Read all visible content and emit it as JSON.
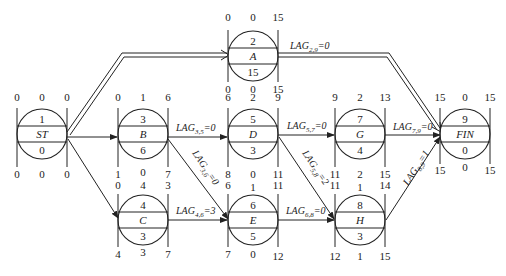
{
  "diagram": {
    "type": "precedence network (single-code)",
    "nodes": [
      {
        "id": "1",
        "name": "ST",
        "duration": "0",
        "es": "0",
        "tf": "0",
        "ef": "0",
        "ls": "0",
        "ff": "0",
        "lf": "0",
        "cx": 42,
        "cy": 134
      },
      {
        "id": "2",
        "name": "A",
        "duration": "15",
        "es": "0",
        "tf": "0",
        "ef": "15",
        "ls": "0",
        "ff": "0",
        "lf": "15",
        "cx": 253,
        "cy": 56
      },
      {
        "id": "3",
        "name": "B",
        "duration": "6",
        "es": "0",
        "tf": "1",
        "ef": "6",
        "ls": "1",
        "ff": "0",
        "lf": "7",
        "cx": 143,
        "cy": 134
      },
      {
        "id": "4",
        "name": "C",
        "duration": "3",
        "es": "0",
        "tf": "4",
        "ef": "3",
        "ls": "4",
        "ff": "3",
        "lf": "7",
        "cx": 143,
        "cy": 220
      },
      {
        "id": "5",
        "name": "D",
        "duration": "3",
        "es": "6",
        "tf": "2",
        "ef": "9",
        "ls": "8",
        "ff": "0",
        "lf": "11",
        "cx": 253,
        "cy": 134
      },
      {
        "id": "6",
        "name": "E",
        "duration": "5",
        "es": "6",
        "tf": "1",
        "ef": "11",
        "ls": "7",
        "ff": "0",
        "lf": "12",
        "cx": 253,
        "cy": 220
      },
      {
        "id": "7",
        "name": "G",
        "duration": "4",
        "es": "9",
        "tf": "2",
        "ef": "13",
        "ls": "11",
        "ff": "2",
        "lf": "15",
        "cx": 360,
        "cy": 134
      },
      {
        "id": "8",
        "name": "H",
        "duration": "3",
        "es": "11",
        "tf": "1",
        "ef": "14",
        "ls": "12",
        "ff": "1",
        "lf": "15",
        "cx": 360,
        "cy": 220
      },
      {
        "id": "9",
        "name": "FIN",
        "duration": "0",
        "es": "15",
        "tf": "0",
        "ef": "15",
        "ls": "15",
        "ff": "0",
        "lf": "15",
        "cx": 465,
        "cy": 134
      }
    ],
    "edges": [
      {
        "from": "1",
        "to": "2",
        "critical": true,
        "lag_label": ""
      },
      {
        "from": "1",
        "to": "3",
        "critical": false,
        "lag_label": ""
      },
      {
        "from": "1",
        "to": "4",
        "critical": false,
        "lag_label": ""
      },
      {
        "from": "2",
        "to": "9",
        "critical": true,
        "lag_label": "LAG",
        "lag_sub": "2,9",
        "lag_val": "=0"
      },
      {
        "from": "3",
        "to": "5",
        "critical": false,
        "lag_label": "LAG",
        "lag_sub": "3,5",
        "lag_val": "=0"
      },
      {
        "from": "3",
        "to": "6",
        "critical": false,
        "lag_label": "LAG",
        "lag_sub": "3,6",
        "lag_val": "=0"
      },
      {
        "from": "4",
        "to": "6",
        "critical": false,
        "lag_label": "LAG",
        "lag_sub": "4,6",
        "lag_val": "=3"
      },
      {
        "from": "5",
        "to": "7",
        "critical": false,
        "lag_label": "LAG",
        "lag_sub": "5,7",
        "lag_val": "=0"
      },
      {
        "from": "5",
        "to": "8",
        "critical": false,
        "lag_label": "LAG",
        "lag_sub": "5,8",
        "lag_val": "=2"
      },
      {
        "from": "6",
        "to": "8",
        "critical": false,
        "lag_label": "LAG",
        "lag_sub": "6,8",
        "lag_val": "=0"
      },
      {
        "from": "7",
        "to": "9",
        "critical": false,
        "lag_label": "LAG",
        "lag_sub": "7,9",
        "lag_val": "=0"
      },
      {
        "from": "8",
        "to": "9",
        "critical": false,
        "lag_label": "LAG",
        "lag_sub": "8,9",
        "lag_val": "=1"
      }
    ]
  }
}
